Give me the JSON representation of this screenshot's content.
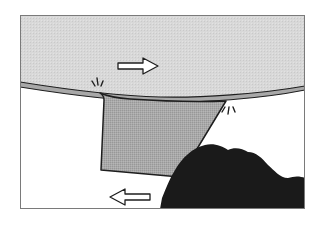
{
  "diagram": {
    "description": "Illustration of two moving surfaces: an upper plate moving right, a lower region moving left, with a trapezoidal wedge between them and a dark rock mass at lower right; stress/crack marks at the two wedge contact points.",
    "elements": {
      "upper_plate": {
        "label": "upper-plate",
        "motion": "right"
      },
      "wedge": {
        "label": "wedge-block"
      },
      "rock": {
        "label": "rock-mass"
      },
      "arrow_right": {
        "label": "motion-right",
        "direction": "right"
      },
      "arrow_left": {
        "label": "motion-left",
        "direction": "left"
      },
      "stress_marks": [
        {
          "label": "stress-mark-left"
        },
        {
          "label": "stress-mark-right"
        }
      ]
    },
    "colors": {
      "background": "#ffffff",
      "frame": "#7a7a7a",
      "upper_plate_fill": "#d6d6d6",
      "plate_edge_fill": "#a8a8a8",
      "outline": "#1e1e1e",
      "wedge_fill": "#a6a6a6",
      "rock_fill": "#1a1a1a",
      "arrow_fill": "#ffffff"
    }
  }
}
